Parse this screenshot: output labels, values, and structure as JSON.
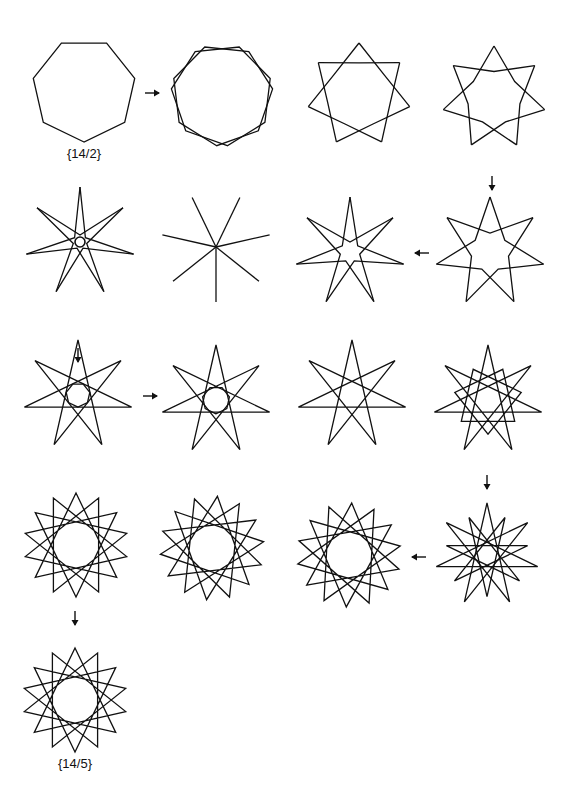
{
  "figure": {
    "stroke_color": "#111111",
    "background": "#ffffff",
    "labels": [
      {
        "text": "{14/2}",
        "x": 84,
        "y": 150
      },
      {
        "text": "{14/5}",
        "x": 75,
        "y": 760
      }
    ],
    "shapes": [
      {
        "id": "s1",
        "cx": 84,
        "cy": 90,
        "r": 52,
        "type": "polygon",
        "n": 7,
        "rot": -90,
        "note": "heptagon {14/2}"
      },
      {
        "id": "s2",
        "cx": 222,
        "cy": 95,
        "r": 52,
        "type": "double-heptagon",
        "n": 7,
        "spread": 6
      },
      {
        "id": "s3",
        "cx": 359,
        "cy": 95,
        "r": 52,
        "type": "twisted",
        "n": 7,
        "t": 0.55
      },
      {
        "id": "s4",
        "cx": 494,
        "cy": 98,
        "r": 52,
        "type": "twisted",
        "n": 7,
        "t": 0.75
      },
      {
        "id": "s5",
        "cx": 80,
        "cy": 242,
        "r": 55,
        "type": "twisted",
        "n": 7,
        "t": 1.45,
        "hole": 5
      },
      {
        "id": "s6",
        "cx": 216,
        "cy": 247,
        "r": 55,
        "type": "spokes",
        "n": 7
      },
      {
        "id": "s7",
        "cx": 350,
        "cy": 252,
        "r": 55,
        "type": "twisted",
        "n": 7,
        "t": 1.35,
        "hole": 0
      },
      {
        "id": "s8",
        "cx": 490,
        "cy": 252,
        "r": 55,
        "type": "twisted",
        "n": 7,
        "t": 1.05
      },
      {
        "id": "s9",
        "cx": 78,
        "cy": 395,
        "r": 55,
        "type": "star",
        "n": 7,
        "k": 3,
        "inner": 0.22
      },
      {
        "id": "s10",
        "cx": 216,
        "cy": 400,
        "r": 55,
        "type": "star",
        "n": 7,
        "k": 3,
        "inner": 0.25
      },
      {
        "id": "s11",
        "cx": 352,
        "cy": 395,
        "r": 55,
        "type": "star",
        "n": 7,
        "k": 2
      },
      {
        "id": "s12",
        "cx": 488,
        "cy": 400,
        "r": 55,
        "type": "mixed",
        "n": 7
      },
      {
        "id": "s13",
        "cx": 76,
        "cy": 545,
        "r": 52,
        "type": "star14",
        "n": 14,
        "k": 5
      },
      {
        "id": "s14",
        "cx": 212,
        "cy": 548,
        "r": 52,
        "type": "star14",
        "n": 14,
        "k": 5,
        "rot": 6
      },
      {
        "id": "s15",
        "cx": 349,
        "cy": 555,
        "r": 52,
        "type": "star14",
        "n": 14,
        "k": 5,
        "rot": 3
      },
      {
        "id": "s16",
        "cx": 487,
        "cy": 555,
        "r": 52,
        "type": "mixed14",
        "n": 14
      },
      {
        "id": "s17",
        "cx": 75,
        "cy": 700,
        "r": 52,
        "type": "star14",
        "n": 14,
        "k": 5
      }
    ],
    "arrows": [
      {
        "dir": "right",
        "x": 152,
        "y": 93
      },
      {
        "dir": "down",
        "x": 492,
        "y": 183
      },
      {
        "dir": "left",
        "x": 422,
        "y": 253
      },
      {
        "dir": "down",
        "x": 78,
        "y": 355
      },
      {
        "dir": "right",
        "x": 150,
        "y": 396
      },
      {
        "dir": "down",
        "x": 487,
        "y": 482
      },
      {
        "dir": "left",
        "x": 419,
        "y": 557
      },
      {
        "dir": "down",
        "x": 75,
        "y": 618
      }
    ]
  }
}
